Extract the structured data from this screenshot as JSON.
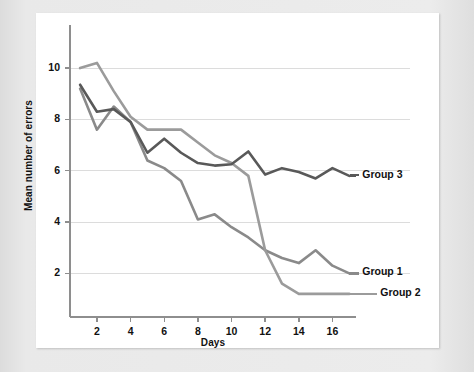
{
  "figure": {
    "background_color": "#ffffff",
    "page_color": "#e8e8e8"
  },
  "chart_data": {
    "type": "line",
    "title": "",
    "xlabel": "Days",
    "ylabel": "Mean number of errors",
    "xlim": [
      0.4,
      17.4
    ],
    "ylim": [
      0.3,
      11.6
    ],
    "xticks": [
      2,
      4,
      6,
      8,
      10,
      12,
      14,
      16
    ],
    "yticks": [
      2,
      4,
      6,
      8,
      10
    ],
    "grid": "horizontal",
    "legend_position": "right-inline-labels",
    "x": [
      1,
      2,
      3,
      4,
      5,
      6,
      7,
      8,
      9,
      10,
      11,
      12,
      13,
      14,
      15,
      16,
      17
    ],
    "series": [
      {
        "name": "Group 1",
        "color": "#8a8a8a",
        "values": [
          9.2,
          7.6,
          8.5,
          7.9,
          6.4,
          6.1,
          5.6,
          4.1,
          4.3,
          3.8,
          3.4,
          2.9,
          2.6,
          2.4,
          2.9,
          2.3,
          2.0
        ]
      },
      {
        "name": "Group 2",
        "color": "#9b9b9b",
        "values": [
          10.0,
          10.2,
          9.1,
          8.1,
          7.6,
          7.6,
          7.6,
          7.1,
          6.6,
          6.3,
          5.8,
          2.9,
          1.6,
          1.2,
          1.2,
          1.2,
          1.2
        ]
      },
      {
        "name": "Group 3",
        "color": "#595959",
        "values": [
          9.35,
          8.3,
          8.4,
          7.9,
          6.7,
          7.25,
          6.7,
          6.3,
          6.2,
          6.25,
          6.75,
          5.85,
          6.1,
          5.95,
          5.7,
          6.1,
          5.8
        ]
      }
    ],
    "series_end_labels": [
      {
        "name": "Group 3",
        "label": "Group 3"
      },
      {
        "name": "Group 1",
        "label": "Group 1"
      },
      {
        "name": "Group 2",
        "label": "Group 2"
      }
    ]
  },
  "axes": {
    "y_tick_labels": [
      "10",
      "8",
      "6",
      "4",
      "2"
    ],
    "x_tick_labels": [
      "2",
      "4",
      "6",
      "8",
      "10",
      "12",
      "14",
      "16"
    ],
    "y_title": "Mean number of errors",
    "x_title": "Days"
  },
  "labels": {
    "group3": "Group 3",
    "group1": "Group 1",
    "group2": "Group 2"
  },
  "colors": {
    "grid": "#dcdcdc",
    "axis": "#8e8e8e",
    "group1": "#8a8a8a",
    "group2": "#9b9b9b",
    "group3": "#595959",
    "text": "#111111"
  }
}
